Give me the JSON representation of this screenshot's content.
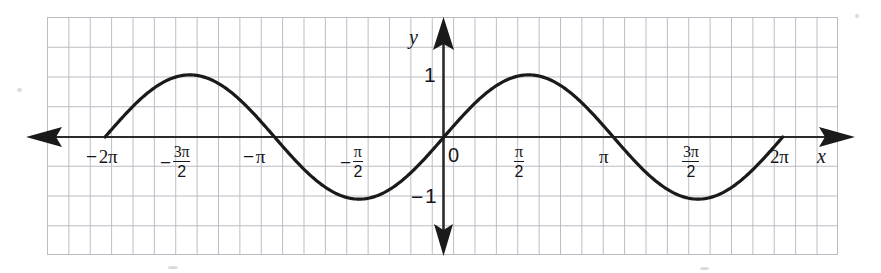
{
  "figure": {
    "kind": "coordinate-graph",
    "background_color": "#ffffff",
    "grid_color": "#b9bcc2",
    "curve_color": "#1a1a1a",
    "axis_color": "#2b2b2b",
    "x_axis_name": "x",
    "y_axis_name": "y",
    "origin_label": "0"
  },
  "chart_data": {
    "type": "line",
    "title": "",
    "xlabel": "x",
    "ylabel": "y",
    "grid": true,
    "legend": "none",
    "function": "y = sin(x)",
    "xlim": [
      -6.283185307,
      6.283185307
    ],
    "ylim": [
      -2.0,
      2.0
    ],
    "x_tick_values": [
      -6.283185307,
      -4.71238898,
      -3.141592653,
      -1.570796327,
      0,
      1.570796327,
      3.141592653,
      4.71238898,
      6.283185307
    ],
    "x_tick_labels": [
      "-2π",
      "-3π/2",
      "-π",
      "-π/2",
      "0",
      "π/2",
      "π",
      "3π/2",
      "2π"
    ],
    "y_tick_values": [
      1,
      -1
    ],
    "y_tick_labels": [
      "1",
      "-1"
    ],
    "x": [
      -6.283185307,
      -5.890486225,
      -5.497787144,
      -5.105088062,
      -4.71238898,
      -4.319689899,
      -3.926990817,
      -3.534291735,
      -3.141592653,
      -2.748893572,
      -2.35619449,
      -1.963495408,
      -1.570796327,
      -1.178097245,
      -0.785398163,
      -0.392699082,
      0,
      0.392699082,
      0.785398163,
      1.178097245,
      1.570796327,
      1.963495408,
      2.35619449,
      2.748893572,
      3.141592653,
      3.534291735,
      3.926990817,
      4.319689899,
      4.71238898,
      5.105088062,
      5.497787144,
      5.890486225,
      6.283185307
    ],
    "y": [
      0,
      0.382683432,
      0.707106781,
      0.923879533,
      1,
      0.923879533,
      0.707106781,
      0.382683432,
      0,
      -0.382683432,
      -0.707106781,
      -0.923879533,
      -1,
      -0.923879533,
      -0.707106781,
      -0.382683432,
      0,
      0.382683432,
      0.707106781,
      0.923879533,
      1,
      0.923879533,
      0.707106781,
      0.382683432,
      0,
      -0.382683432,
      -0.707106781,
      -0.923879533,
      -1,
      -0.923879533,
      -0.707106781,
      -0.382683432,
      0
    ]
  },
  "x_ticks": [
    {
      "id": "neg-2pi",
      "text": "-2π",
      "num": "",
      "den": "",
      "negative": true,
      "stacked": false,
      "base": "2π"
    },
    {
      "id": "neg-3pi-2",
      "text": "-3π/2",
      "num": "3π",
      "den": "2",
      "negative": true,
      "stacked": true,
      "base": ""
    },
    {
      "id": "neg-pi",
      "text": "-π",
      "num": "",
      "den": "",
      "negative": true,
      "stacked": false,
      "base": "π"
    },
    {
      "id": "neg-pi-2",
      "text": "-π/2",
      "num": "π",
      "den": "2",
      "negative": true,
      "stacked": true,
      "base": ""
    },
    {
      "id": "pi-2",
      "text": "π/2",
      "num": "π",
      "den": "2",
      "negative": false,
      "stacked": true,
      "base": ""
    },
    {
      "id": "pi",
      "text": "π",
      "num": "",
      "den": "",
      "negative": false,
      "stacked": false,
      "base": "π"
    },
    {
      "id": "3pi-2",
      "text": "3π/2",
      "num": "3π",
      "den": "2",
      "negative": false,
      "stacked": true,
      "base": ""
    },
    {
      "id": "2pi",
      "text": "2π",
      "num": "",
      "den": "",
      "negative": false,
      "stacked": false,
      "base": "2π"
    }
  ],
  "y_ticks": [
    {
      "id": "y-one",
      "text": "1"
    },
    {
      "id": "y-neg-one",
      "text": "-1"
    }
  ]
}
